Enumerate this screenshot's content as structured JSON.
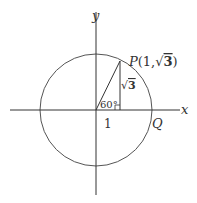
{
  "diagram": {
    "type": "unit-circle-angle",
    "axes": {
      "x_label": "x",
      "y_label": "y"
    },
    "point_p": {
      "label": "P(1,√3)",
      "name": "P",
      "coords": "(1,√3)"
    },
    "point_q": {
      "label": "Q"
    },
    "angle": {
      "label": "60°",
      "degrees": 60
    },
    "adjacent_side": {
      "label": "1"
    },
    "opposite_side": {
      "label": "√3"
    },
    "colors": {
      "stroke": "#333333",
      "circle": "#555555",
      "background": "#ffffff"
    }
  }
}
